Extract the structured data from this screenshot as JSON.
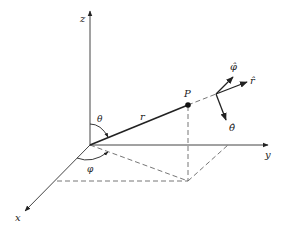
{
  "diagram": {
    "axes": {
      "x_label": "x",
      "y_label": "y",
      "z_label": "z"
    },
    "point_label": "P",
    "radius_label": "r",
    "angles": {
      "theta": "θ",
      "phi": "φ"
    },
    "unit_vectors": {
      "r_hat": "r̂",
      "theta_hat": "θ̂",
      "phi_hat": "φ̂"
    },
    "colors": {
      "line": "#222222",
      "dashed": "#666666",
      "background": "#ffffff"
    }
  }
}
